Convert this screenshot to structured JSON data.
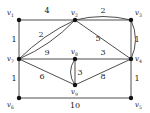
{
  "figure": {
    "background_color": "#ffffff",
    "edge_color": "#3a3a3a",
    "vertex_color": "#111111",
    "label_color": "#1a1a1a"
  },
  "vertices": [
    {
      "id": "v1",
      "name": "v",
      "sub": "1",
      "x": 19,
      "y": 20
    },
    {
      "id": "v2",
      "name": "v",
      "sub": "2",
      "x": 75,
      "y": 20
    },
    {
      "id": "v3",
      "name": "v",
      "sub": "3",
      "x": 131,
      "y": 20
    },
    {
      "id": "v4",
      "name": "v",
      "sub": "4",
      "x": 131,
      "y": 59
    },
    {
      "id": "v5",
      "name": "v",
      "sub": "5",
      "x": 131,
      "y": 98
    },
    {
      "id": "v6",
      "name": "v",
      "sub": "6",
      "x": 19,
      "y": 98
    },
    {
      "id": "v7",
      "name": "v",
      "sub": "7",
      "x": 19,
      "y": 59
    },
    {
      "id": "v8",
      "name": "v",
      "sub": "8",
      "x": 75,
      "y": 59
    },
    {
      "id": "v9",
      "name": "v",
      "sub": "9",
      "x": 75,
      "y": 85
    }
  ],
  "edges": [
    {
      "id": "e-v1-v2",
      "from": "v1",
      "to": "v2",
      "weight": "4",
      "shape": "straight",
      "label_x": 47,
      "label_y": 13
    },
    {
      "id": "e-v2-v3a",
      "from": "v2",
      "to": "v3",
      "weight": "2",
      "shape": "straight",
      "label_x": 103,
      "label_y": 13
    },
    {
      "id": "e-v2-v3b",
      "from": "v2",
      "to": "v3",
      "weight": "",
      "shape": "curve-down",
      "label_x": 0,
      "label_y": 0
    },
    {
      "id": "e-v1-v7",
      "from": "v1",
      "to": "v7",
      "weight": "1",
      "shape": "straight",
      "label_x": 14,
      "label_y": 42
    },
    {
      "id": "e-v2-v7a",
      "from": "v2",
      "to": "v7",
      "weight": "2",
      "shape": "curve-up",
      "label_x": 41,
      "label_y": 37
    },
    {
      "id": "e-v2-v7b",
      "from": "v2",
      "to": "v7",
      "weight": "",
      "shape": "curve-down",
      "label_x": 0,
      "label_y": 0
    },
    {
      "id": "e-v2-v4",
      "from": "v2",
      "to": "v4",
      "weight": "5",
      "shape": "straight",
      "label_x": 98,
      "label_y": 41
    },
    {
      "id": "e-v3-v4a",
      "from": "v3",
      "to": "v4",
      "weight": "1",
      "shape": "straight",
      "label_x": 137,
      "label_y": 42
    },
    {
      "id": "e-v3-v4b",
      "from": "v3",
      "to": "v4",
      "weight": "",
      "shape": "curve-left",
      "label_x": 0,
      "label_y": 0
    },
    {
      "id": "e-v7-v8",
      "from": "v7",
      "to": "v8",
      "weight": "9",
      "shape": "straight",
      "label_x": 47,
      "label_y": 55
    },
    {
      "id": "e-v8-v4",
      "from": "v8",
      "to": "v4",
      "weight": "3",
      "shape": "straight",
      "label_x": 103,
      "label_y": 55
    },
    {
      "id": "e-v7-v6",
      "from": "v7",
      "to": "v6",
      "weight": "1",
      "shape": "straight",
      "label_x": 14,
      "label_y": 81
    },
    {
      "id": "e-v7-v9",
      "from": "v7",
      "to": "v9",
      "weight": "6",
      "shape": "straight",
      "label_x": 42,
      "label_y": 79
    },
    {
      "id": "e-v8-v9a",
      "from": "v8",
      "to": "v9",
      "weight": "3",
      "shape": "curve-right",
      "label_x": 80,
      "label_y": 75
    },
    {
      "id": "e-v8-v9b",
      "from": "v8",
      "to": "v9",
      "weight": "",
      "shape": "straight",
      "label_x": 0,
      "label_y": 0
    },
    {
      "id": "e-v9-v4",
      "from": "v9",
      "to": "v4",
      "weight": "8",
      "shape": "straight",
      "label_x": 103,
      "label_y": 79
    },
    {
      "id": "e-v4-v5",
      "from": "v4",
      "to": "v5",
      "weight": "1",
      "shape": "straight",
      "label_x": 137,
      "label_y": 81
    },
    {
      "id": "e-v6-v5",
      "from": "v6",
      "to": "v5",
      "weight": "10",
      "shape": "straight",
      "label_x": 75,
      "label_y": 108
    }
  ]
}
